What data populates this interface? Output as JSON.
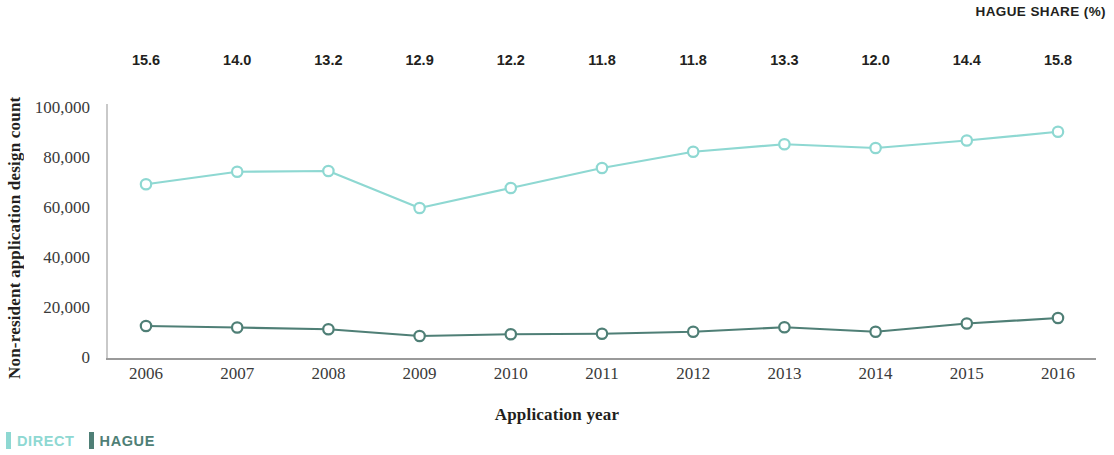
{
  "header": {
    "hague_share_title": "HAGUE SHARE (%)"
  },
  "axes": {
    "ylabel": "Non-resident application design count",
    "xlabel": "Application year"
  },
  "legend": {
    "items": [
      {
        "label": "DIRECT",
        "color": "#8ed8d2"
      },
      {
        "label": "HAGUE",
        "color": "#4f7f76"
      }
    ]
  },
  "chart_data": {
    "type": "line",
    "title": "",
    "subtitle": "",
    "xlabel": "Application year",
    "ylabel": "Non-resident application design count",
    "ylim": [
      0,
      100000
    ],
    "yticks": [
      0,
      20000,
      40000,
      60000,
      80000,
      100000
    ],
    "ytick_labels": [
      "0",
      "20,000",
      "40,000",
      "60,000",
      "80,000",
      "100,000"
    ],
    "grid": false,
    "legend_position": "bottom-left",
    "categories": [
      2006,
      2007,
      2008,
      2009,
      2010,
      2011,
      2012,
      2013,
      2014,
      2015,
      2016
    ],
    "xtick_labels": [
      "2006",
      "2007",
      "2008",
      "2009",
      "2010",
      "2011",
      "2012",
      "2013",
      "2014",
      "2015",
      "2016"
    ],
    "series": [
      {
        "name": "DIRECT",
        "color": "#8ed8d2",
        "marker": "open-circle",
        "values": [
          69500,
          74500,
          74800,
          60000,
          68000,
          76000,
          82500,
          85500,
          84000,
          87000,
          90500
        ]
      },
      {
        "name": "HAGUE",
        "color": "#4f7f76",
        "marker": "open-circle",
        "values": [
          12800,
          12200,
          11500,
          8800,
          9500,
          9700,
          10500,
          12300,
          10500,
          13800,
          16000
        ]
      }
    ],
    "annotations": {
      "name": "HAGUE SHARE (%)",
      "position": "top",
      "values": [
        15.6,
        14.0,
        13.2,
        12.9,
        12.2,
        11.8,
        11.8,
        13.3,
        12.0,
        14.4,
        15.8
      ],
      "labels": [
        "15.6",
        "14.0",
        "13.2",
        "12.9",
        "12.2",
        "11.8",
        "11.8",
        "13.3",
        "12.0",
        "14.4",
        "15.8"
      ]
    }
  }
}
